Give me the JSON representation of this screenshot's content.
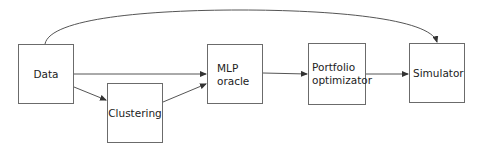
{
  "diagram": {
    "type": "flowchart",
    "nodes": [
      {
        "id": "data",
        "label": "Data"
      },
      {
        "id": "clustering",
        "label": "Clustering"
      },
      {
        "id": "mlp",
        "label": "MLP\noracle"
      },
      {
        "id": "portfolio",
        "label": "Portfolio\noptimizator"
      },
      {
        "id": "simulator",
        "label": "Simulator"
      }
    ],
    "edges": [
      {
        "from": "data",
        "to": "mlp"
      },
      {
        "from": "data",
        "to": "clustering"
      },
      {
        "from": "clustering",
        "to": "mlp"
      },
      {
        "from": "mlp",
        "to": "portfolio"
      },
      {
        "from": "portfolio",
        "to": "simulator"
      },
      {
        "from": "data",
        "to": "simulator",
        "style": "curved"
      }
    ],
    "colors": {
      "stroke": "#6b6b6b",
      "arrow": "#333333",
      "text": "#222222",
      "background": "#ffffff"
    }
  }
}
